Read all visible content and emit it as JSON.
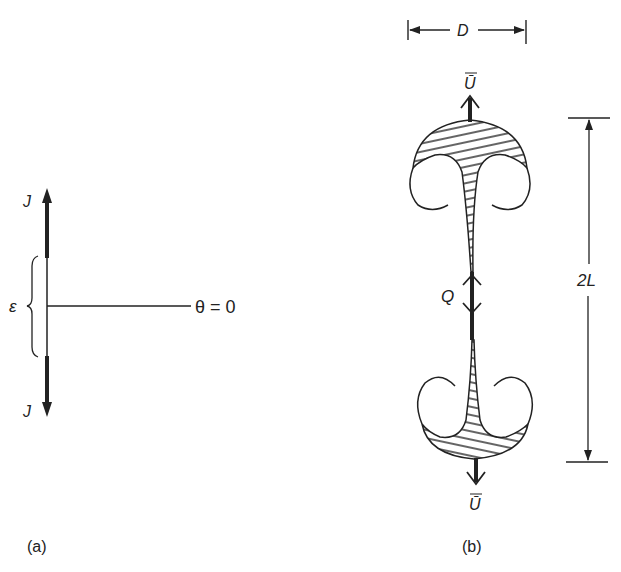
{
  "figure": {
    "panel_a": {
      "caption": "(a)",
      "jet_top_label": "J",
      "jet_bottom_label": "J",
      "gap_label": "ε",
      "axis_label": "θ = 0"
    },
    "panel_b": {
      "caption": "(b)",
      "width_label": "D",
      "length_label": "2L",
      "source_label": "Q",
      "top_velocity_label": "Ū",
      "bottom_velocity_label": "Ū"
    }
  },
  "colors": {
    "ink": "#222222",
    "background": "#ffffff"
  }
}
